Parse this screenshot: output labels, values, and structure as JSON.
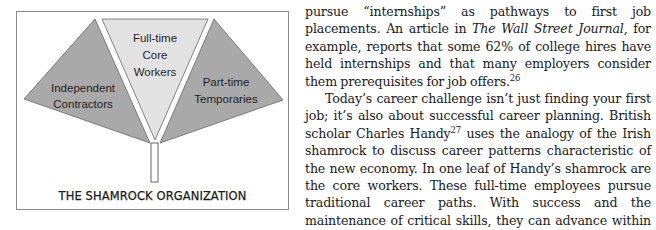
{
  "figure": {
    "caption": "THE SHAMROCK ORGANIZATION",
    "leaves": {
      "left": {
        "line1": "Independent",
        "line2": "Contractors",
        "fill": "#a9a9a9"
      },
      "center": {
        "line1": "Full-time",
        "line2": "Core",
        "line3": "Workers",
        "fill": "#e2e2e2"
      },
      "right": {
        "line1": "Part-time",
        "line2": "Temporaries",
        "fill": "#a9a9a9"
      }
    },
    "stem_fill": "#ffffff",
    "stroke_color": "#555555"
  },
  "article": {
    "para1": {
      "before_italic": "pursue “internships” as pathways to first job placements. An article in ",
      "italic": "The Wall Street Journal",
      "after_italic": ", for example, reports that some 62% of college hires have held internships and that many employers consider them prerequisites for job offers.",
      "footnote": "26"
    },
    "para2": {
      "before_footnote": "Today’s career challenge isn’t just finding your first job; it’s also about successful career planning. British scholar Charles Handy",
      "footnote": "27",
      "after_footnote": " uses the analogy of the Irish shamrock to discuss career patterns characteristic of the new economy. In one leaf of Handy’s shamrock are the core workers. These full-time employees pursue traditional career paths. With success and the maintenance of critical skills, they can advance within the organization and may remain employed for a long time. In the second leaf are contract workers. They perform"
    }
  }
}
